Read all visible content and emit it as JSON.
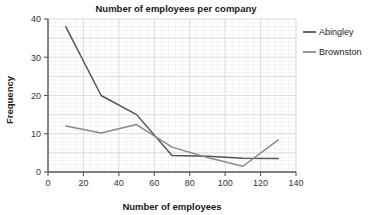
{
  "chart_data": {
    "type": "line",
    "title": "Number of employees per company",
    "xlabel": "Number of employees",
    "ylabel": "Frequency",
    "xlim": [
      0,
      140
    ],
    "ylim": [
      0,
      40
    ],
    "xticks": [
      0,
      20,
      40,
      60,
      80,
      100,
      120,
      140
    ],
    "yticks": [
      0,
      10,
      20,
      30,
      40
    ],
    "grid": true,
    "legend_position": "right",
    "x": [
      10,
      30,
      50,
      70,
      90,
      110,
      130
    ],
    "series": [
      {
        "name": "Abingley",
        "color": "#555555",
        "values": [
          38,
          20,
          15,
          4.3,
          4.1,
          3.6,
          3.5
        ]
      },
      {
        "name": "Brownston",
        "color": "#8a8a8a",
        "values": [
          12,
          10.2,
          12.4,
          6.5,
          3.8,
          1.5,
          8.4
        ]
      }
    ]
  },
  "legend": {
    "items": [
      {
        "label": "Abingley"
      },
      {
        "label": "Brownston"
      }
    ]
  },
  "axis": {
    "x_tick_labels": [
      "0",
      "20",
      "40",
      "60",
      "80",
      "100",
      "120",
      "140"
    ],
    "y_tick_labels": [
      "0",
      "10",
      "20",
      "30",
      "40"
    ]
  }
}
